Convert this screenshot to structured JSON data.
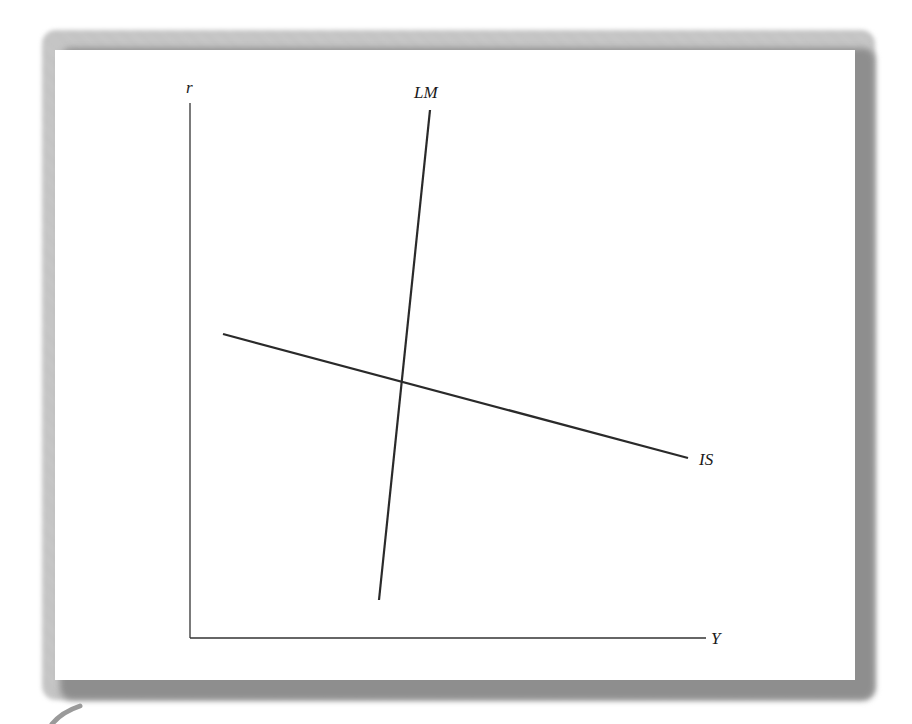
{
  "diagram": {
    "axes": {
      "y_label": "r",
      "x_label": "Y"
    },
    "curves": [
      {
        "name": "LM",
        "label": "LM",
        "x1": 430,
        "y1": 110,
        "x2": 379,
        "y2": 600
      },
      {
        "name": "IS",
        "label": "IS",
        "x1": 223,
        "y1": 334,
        "x2": 688,
        "y2": 458
      }
    ],
    "equilibrium": {
      "x": 401,
      "y": 382
    },
    "colors": {
      "line": "#2a2a2a",
      "axis": "#333333",
      "frame_shadow": "#9a9a9a"
    }
  }
}
